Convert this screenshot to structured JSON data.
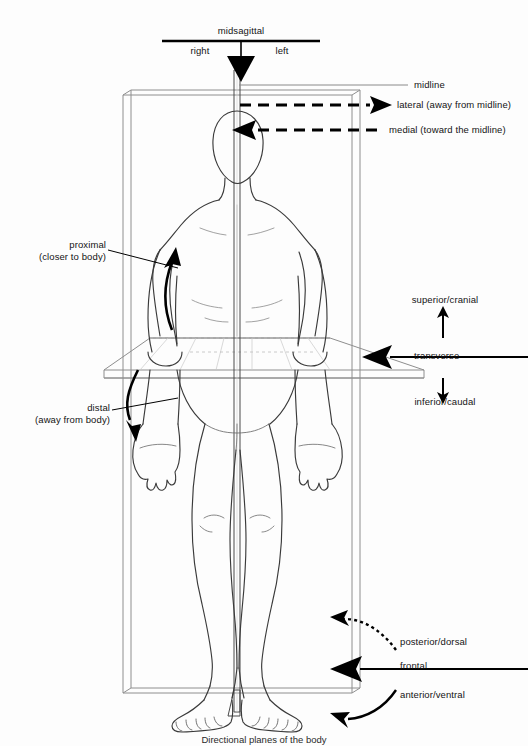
{
  "figure": {
    "caption": "Directional planes of the body",
    "colors": {
      "ink": "#141414",
      "body_outline": "#3a3a3a",
      "plane_line": "#8a8a8a",
      "background": "#fdfdfd",
      "arrow_fill": "#000000"
    }
  },
  "top_scale": {
    "plane_label": "midsagittal",
    "left_half_label": "right",
    "right_half_label": "left"
  },
  "right_labels": {
    "midline": "midline",
    "lateral": "lateral (away from midline)",
    "medial": "medial (toward the midline)"
  },
  "left_labels": {
    "proximal_line1": "proximal",
    "proximal_line2": "(closer to body)",
    "distal_line1": "distal",
    "distal_line2": "(away from body)"
  },
  "transverse_group": {
    "superior": "superior/cranial",
    "plane": "transverse",
    "inferior": "inferior/caudal"
  },
  "frontal_group": {
    "posterior": "posterior/dorsal",
    "plane": "frontal",
    "anterior": "anterior/ventral"
  }
}
